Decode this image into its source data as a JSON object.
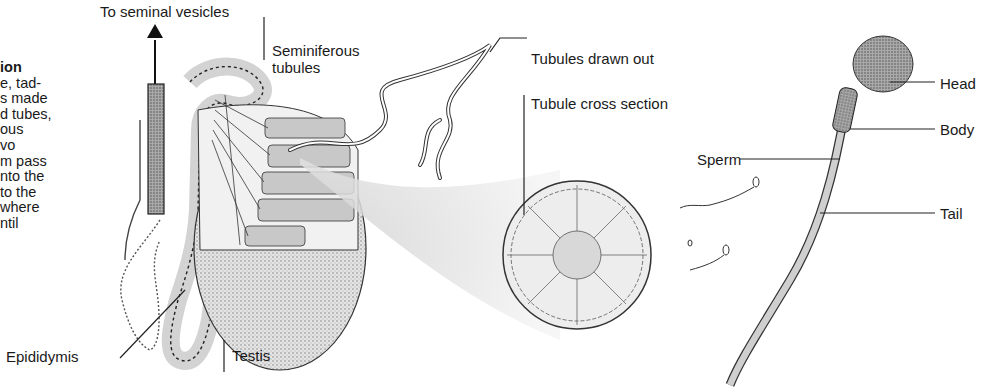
{
  "side_text": {
    "heading": "ion",
    "lines": [
      "e, tad-",
      "s made",
      "d tubes,",
      "ous",
      "vo",
      "m pass",
      "nto the",
      "to the",
      "where",
      "ntil"
    ]
  },
  "labels": {
    "seminal": "To seminal vesicles",
    "seminiferous_1": "Seminiferous",
    "seminiferous_2": "tubules",
    "drawn_out": "Tubules drawn out",
    "cross_section": "Tubule cross section",
    "sperm": "Sperm",
    "head": "Head",
    "body": "Body",
    "tail": "Tail",
    "epididymis": "Epididymis",
    "testis": "Testis"
  },
  "colors": {
    "ink": "#1a1a1a",
    "shade": "#bdbdbd",
    "light": "#e2e2e2"
  }
}
